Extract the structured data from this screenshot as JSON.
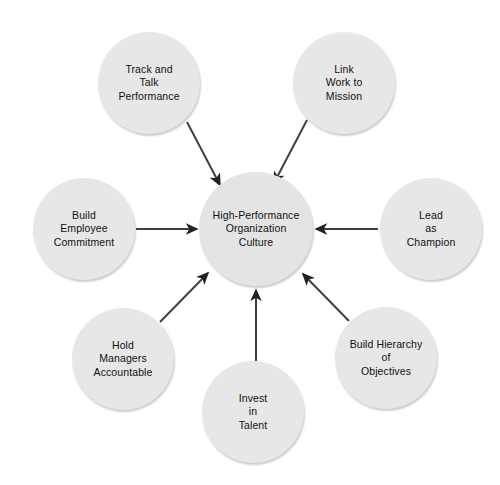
{
  "diagram": {
    "background_color": "#ffffff",
    "node_fill_color": "#e7e7e7",
    "text_color": "#111111",
    "arrow_color": "#404040",
    "center": {
      "id": "high-performance-organization-culture",
      "label": "High-Performance\nOrganization\nCulture",
      "lines": [
        "High-Performance",
        "Organization",
        "Culture"
      ],
      "cx": 256,
      "cy": 229,
      "r": 57
    },
    "satellites": [
      {
        "id": "track-and-talk-performance",
        "label": "Track and\nTalk\nPerformance",
        "lines": [
          "Track and",
          "Talk",
          "Performance"
        ],
        "cx": 149,
        "cy": 83,
        "r": 51,
        "position": "top-left"
      },
      {
        "id": "link-work-to-mission",
        "label": "Link\nWork to\nMission",
        "lines": [
          "Link",
          "Work to",
          "Mission"
        ],
        "cx": 344,
        "cy": 83,
        "r": 51,
        "position": "top-right"
      },
      {
        "id": "build-employee-commitment",
        "label": "Build\nEmployee\nCommitment",
        "lines": [
          "Build",
          "Employee",
          "Commitment"
        ],
        "cx": 84,
        "cy": 229,
        "r": 51,
        "position": "left"
      },
      {
        "id": "lead-as-champion",
        "label": "Lead\nas\nChampion",
        "lines": [
          "Lead",
          "as",
          "Champion"
        ],
        "cx": 431,
        "cy": 229,
        "r": 51,
        "position": "right"
      },
      {
        "id": "hold-managers-accountable",
        "label": "Hold\nManagers\nAccountable",
        "lines": [
          "Hold",
          "Managers",
          "Accountable"
        ],
        "cx": 123,
        "cy": 359,
        "r": 51,
        "position": "bottom-left"
      },
      {
        "id": "invest-in-talent",
        "label": "Invest\nin\nTalent",
        "lines": [
          "Invest",
          "in",
          "Talent"
        ],
        "cx": 253,
        "cy": 412,
        "r": 51,
        "position": "bottom"
      },
      {
        "id": "build-hierarchy-of-objectives",
        "label": "Build Hierarchy\nof\nObjectives",
        "lines": [
          "Build Hierarchy",
          "of",
          "Objectives"
        ],
        "cx": 386,
        "cy": 358,
        "r": 51,
        "position": "bottom-right"
      }
    ],
    "arrows": [
      {
        "id": "arrow-track-and-talk-performance",
        "from": "track-and-talk-performance",
        "to": "high-performance-organization-culture",
        "x1": 187,
        "y1": 122,
        "x2": 220,
        "y2": 185
      },
      {
        "id": "arrow-link-work-to-mission",
        "from": "link-work-to-mission",
        "to": "high-performance-organization-culture",
        "x1": 307,
        "y1": 120,
        "x2": 274,
        "y2": 183
      },
      {
        "id": "arrow-build-employee-commitment",
        "from": "build-employee-commitment",
        "to": "high-performance-organization-culture",
        "x1": 136,
        "y1": 229,
        "x2": 197,
        "y2": 229
      },
      {
        "id": "arrow-lead-as-champion",
        "from": "lead-as-champion",
        "to": "high-performance-organization-culture",
        "x1": 378,
        "y1": 229,
        "x2": 316,
        "y2": 229
      },
      {
        "id": "arrow-hold-managers-accountable",
        "from": "hold-managers-accountable",
        "to": "high-performance-organization-culture",
        "x1": 160,
        "y1": 322,
        "x2": 208,
        "y2": 273
      },
      {
        "id": "arrow-invest-in-talent",
        "from": "invest-in-talent",
        "to": "high-performance-organization-culture",
        "x1": 256,
        "y1": 361,
        "x2": 256,
        "y2": 290
      },
      {
        "id": "arrow-build-hierarchy-of-objectives",
        "from": "build-hierarchy-of-objectives",
        "to": "high-performance-organization-culture",
        "x1": 349,
        "y1": 321,
        "x2": 303,
        "y2": 274
      }
    ]
  }
}
